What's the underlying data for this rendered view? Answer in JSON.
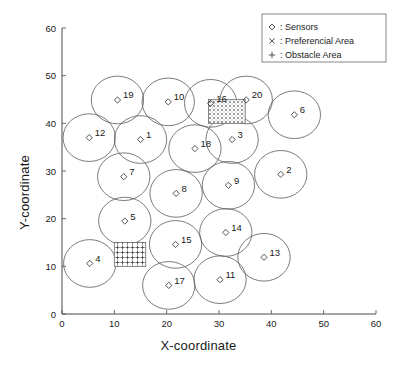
{
  "chart_data": {
    "type": "scatter",
    "title": "",
    "xlabel": "X-coordinate",
    "ylabel": "Y-coordinate",
    "xlim": [
      0,
      60
    ],
    "ylim": [
      0,
      60
    ],
    "xticks": [
      0,
      10,
      20,
      30,
      40,
      50,
      60
    ],
    "yticks": [
      0,
      10,
      20,
      30,
      40,
      50,
      60
    ],
    "grid": false,
    "legend_position": "top-right",
    "legend": [
      {
        "marker": "diamond-icon",
        "label": ": Sensors"
      },
      {
        "marker": "cross-x-icon",
        "label": ": Preferencial Area"
      },
      {
        "marker": "plus-icon",
        "label": ": Obstacle Area"
      }
    ],
    "sensor_radius": 5.0,
    "series": [
      {
        "name": "Sensors",
        "marker": "diamond",
        "points": [
          {
            "id": "1",
            "x": 15.0,
            "y": 36.6
          },
          {
            "id": "2",
            "x": 41.8,
            "y": 29.3
          },
          {
            "id": "3",
            "x": 32.5,
            "y": 36.6
          },
          {
            "id": "4",
            "x": 5.3,
            "y": 10.6
          },
          {
            "id": "5",
            "x": 12.0,
            "y": 19.5
          },
          {
            "id": "6",
            "x": 44.4,
            "y": 41.8
          },
          {
            "id": "7",
            "x": 11.8,
            "y": 28.8
          },
          {
            "id": "8",
            "x": 21.8,
            "y": 25.3
          },
          {
            "id": "9",
            "x": 31.8,
            "y": 27.0
          },
          {
            "id": "10",
            "x": 20.3,
            "y": 44.5
          },
          {
            "id": "11",
            "x": 30.2,
            "y": 7.2
          },
          {
            "id": "12",
            "x": 5.2,
            "y": 37.0
          },
          {
            "id": "13",
            "x": 38.6,
            "y": 11.9
          },
          {
            "id": "14",
            "x": 31.3,
            "y": 17.1
          },
          {
            "id": "15",
            "x": 21.7,
            "y": 14.6
          },
          {
            "id": "16",
            "x": 28.4,
            "y": 44.2
          },
          {
            "id": "17",
            "x": 20.4,
            "y": 6.0
          },
          {
            "id": "18",
            "x": 25.4,
            "y": 34.7
          },
          {
            "id": "19",
            "x": 10.6,
            "y": 44.9
          },
          {
            "id": "20",
            "x": 35.2,
            "y": 44.9
          }
        ]
      }
    ],
    "regions": [
      {
        "name": "preferencial-area",
        "fill": "cross-x-hatch",
        "x0": 28.0,
        "y0": 40.0,
        "x1": 35.0,
        "y1": 45.0
      },
      {
        "name": "obstacle-area",
        "fill": "plus-grid-hatch",
        "x0": 10.0,
        "y0": 10.0,
        "x1": 16.0,
        "y1": 15.0
      }
    ],
    "colors": {
      "axis": "#4a4a4a",
      "circle": "#5a5a5a",
      "text": "#1a1a1a",
      "background": "#ffffff"
    }
  }
}
